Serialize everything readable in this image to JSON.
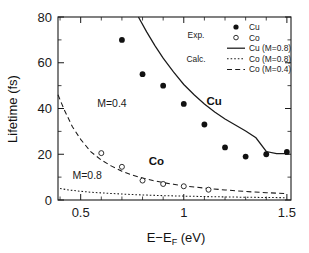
{
  "chart_data": {
    "type": "scatter",
    "title": "",
    "xlabel": "E−E_F (eV)",
    "xlabel_main": "E−E",
    "xlabel_sub": "F",
    "xlabel_unit": " (eV)",
    "ylabel": "Lifetime (fs)",
    "xlim": [
      0.39,
      1.52
    ],
    "ylim": [
      0,
      80
    ],
    "xticks": [
      0.5,
      1.0,
      1.5
    ],
    "xticklabels": [
      "0.5",
      "1",
      "1.5"
    ],
    "yticks": [
      0,
      20,
      40,
      60,
      80
    ],
    "yticklabels": [
      "0",
      "20",
      "40",
      "60",
      "80"
    ],
    "grid": false,
    "legend_position": "top-right",
    "series": [
      {
        "name": "Cu",
        "kind": "points-filled",
        "legend_label": "Cu",
        "group": "Exp.",
        "x": [
          0.7,
          0.8,
          0.9,
          1.0,
          1.1,
          1.2,
          1.3,
          1.4,
          1.5
        ],
        "y": [
          70,
          55,
          50,
          42,
          33,
          23,
          19,
          20,
          21
        ]
      },
      {
        "name": "Co",
        "kind": "points-open",
        "legend_label": "Co",
        "group": "Exp.",
        "x": [
          0.6,
          0.7,
          0.8,
          0.9,
          1.0,
          1.12
        ],
        "y": [
          20.5,
          14.5,
          8.5,
          7.0,
          6.0,
          4.5
        ]
      },
      {
        "name": "Cu (M=0.8)",
        "kind": "line-solid",
        "legend_label": "Cu (M=0.8)",
        "group": "Calc.",
        "x": [
          0.78,
          0.82,
          0.86,
          0.9,
          0.95,
          1.0,
          1.05,
          1.1,
          1.15,
          1.2,
          1.25,
          1.3,
          1.35,
          1.4,
          1.45,
          1.5
        ],
        "y": [
          80,
          73.5,
          67.5,
          62.0,
          56.0,
          50.5,
          46.0,
          42.0,
          38.5,
          35.4,
          32.8,
          30.2,
          27.2,
          21.2,
          20.3,
          20.3
        ]
      },
      {
        "name": "Co (M=0.8)",
        "kind": "line-dotted",
        "legend_label": "Co (M=0.8)",
        "group": "Calc.",
        "x": [
          0.4,
          0.45,
          0.5,
          0.55,
          0.6,
          0.7,
          0.8,
          0.9,
          1.0,
          1.1,
          1.2,
          1.3,
          1.4,
          1.5
        ],
        "y": [
          5.0,
          4.3,
          3.8,
          3.4,
          3.1,
          2.6,
          2.2,
          1.9,
          1.7,
          1.5,
          1.35,
          1.2,
          1.1,
          1.0
        ]
      },
      {
        "name": "Co (M=0.4)",
        "kind": "line-dashed",
        "legend_label": "Co (M=0.4)",
        "group": "Calc.",
        "x": [
          0.39,
          0.42,
          0.46,
          0.5,
          0.55,
          0.6,
          0.65,
          0.7,
          0.75,
          0.8,
          0.85,
          0.9,
          0.95,
          1.0,
          1.05,
          1.1,
          1.2,
          1.3,
          1.4,
          1.5
        ],
        "y": [
          46.0,
          39.5,
          32.0,
          26.5,
          21.0,
          17.5,
          14.8,
          12.6,
          10.9,
          9.6,
          8.5,
          7.6,
          6.9,
          6.2,
          5.7,
          5.2,
          4.4,
          3.7,
          3.2,
          2.8
        ]
      }
    ],
    "annotations": [
      {
        "id": "m04",
        "text": "M=0.4",
        "x": 0.58,
        "y": 40.5
      },
      {
        "id": "m08",
        "text": "M=0.8",
        "x": 0.46,
        "y": 9.0
      },
      {
        "id": "cu-label",
        "text": "Cu",
        "x": 1.11,
        "y": 41.5,
        "bold": true
      },
      {
        "id": "co-label",
        "text": "Co",
        "x": 0.83,
        "y": 15.5,
        "bold": true
      }
    ]
  },
  "legend": {
    "group_exp": "Exp.",
    "group_calc": "Calc.",
    "entries": [
      {
        "label": "Cu",
        "marker": "filled-circle"
      },
      {
        "label": "Co",
        "marker": "open-circle"
      },
      {
        "label": "Cu (M=0.8)",
        "marker": "solid-line"
      },
      {
        "label": "Co (M=0.8)",
        "marker": "dotted-line"
      },
      {
        "label": "Co (M=0.4)",
        "marker": "dashed-line"
      }
    ]
  },
  "colors": {
    "ink": "#1a1a1a",
    "background": "#ffffff"
  }
}
